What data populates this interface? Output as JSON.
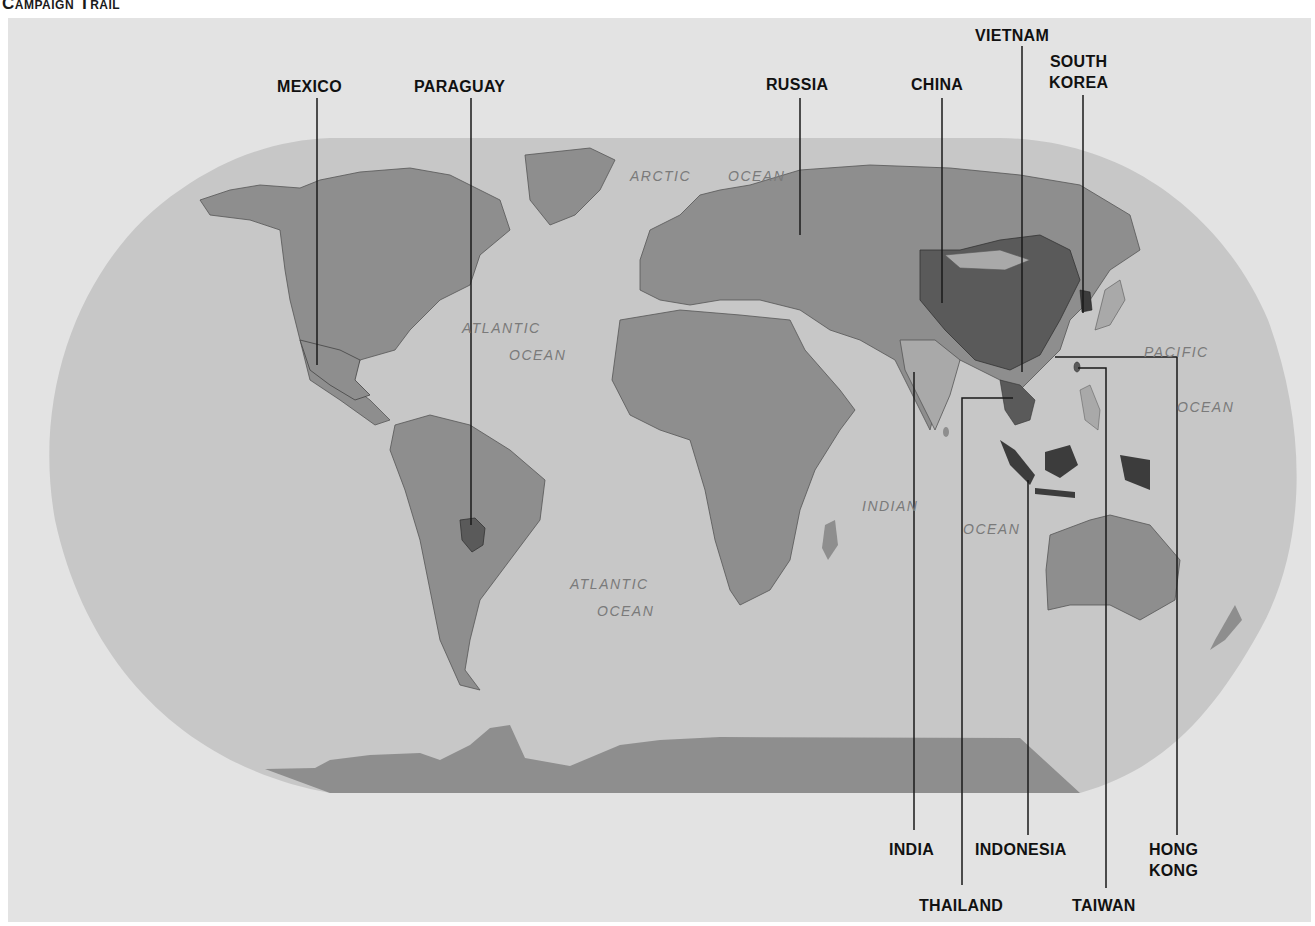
{
  "title": "Campaign Trail",
  "colors": {
    "background": "#e3e3e3",
    "ocean": "#c7c7c7",
    "land": "#8e8e8e",
    "land_light": "#a9a9a9",
    "highlight": "#5a5a5a",
    "highlight_dark": "#3c3c3c",
    "leader_line": "#1a1a1a"
  },
  "countries": [
    {
      "id": "mexico",
      "label": "MEXICO"
    },
    {
      "id": "paraguay",
      "label": "PARAGUAY"
    },
    {
      "id": "russia",
      "label": "RUSSIA"
    },
    {
      "id": "china",
      "label": "CHINA"
    },
    {
      "id": "vietnam",
      "label": "VIETNAM"
    },
    {
      "id": "south-korea",
      "label_line1": "SOUTH",
      "label_line2": "KOREA"
    },
    {
      "id": "india",
      "label": "INDIA"
    },
    {
      "id": "indonesia",
      "label": "INDONESIA"
    },
    {
      "id": "hong-kong",
      "label_line1": "HONG",
      "label_line2": "KONG"
    },
    {
      "id": "thailand",
      "label": "THAILAND"
    },
    {
      "id": "taiwan",
      "label": "TAIWAN"
    }
  ],
  "oceans": [
    {
      "id": "arctic",
      "word1": "ARCTIC",
      "word2": "OCEAN"
    },
    {
      "id": "north-atlantic",
      "word1": "ATLANTIC",
      "word2": "OCEAN"
    },
    {
      "id": "south-atlantic",
      "word1": "ATLANTIC",
      "word2": "OCEAN"
    },
    {
      "id": "indian",
      "word1": "INDIAN",
      "word2": "OCEAN"
    },
    {
      "id": "pacific",
      "word1": "PACIFIC",
      "word2": "OCEAN"
    }
  ]
}
